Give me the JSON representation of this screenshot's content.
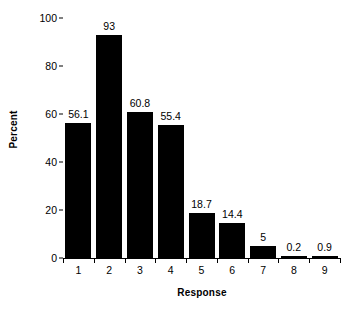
{
  "chart_data": {
    "type": "bar",
    "title": "",
    "subtitle": "",
    "categories": [
      "1",
      "2",
      "3",
      "4",
      "5",
      "6",
      "7",
      "8",
      "9"
    ],
    "values": [
      56.1,
      93,
      60.8,
      55.4,
      18.7,
      14.4,
      5,
      0.2,
      0.9
    ],
    "value_labels": [
      "56.1",
      "93",
      "60.8",
      "55.4",
      "18.7",
      "14.4",
      "5",
      "0.2",
      "0.9"
    ],
    "xlabel": "Response",
    "ylabel": "Percent",
    "ylim": [
      0,
      100
    ],
    "yticks": [
      0,
      20,
      40,
      60,
      80,
      100
    ],
    "ytick_labels": [
      "0",
      "20",
      "40",
      "60",
      "80",
      "100"
    ],
    "grid": false,
    "legend": null,
    "bar_color": "#000000",
    "background_color": "#ffffff",
    "axis_color": "#000000"
  }
}
